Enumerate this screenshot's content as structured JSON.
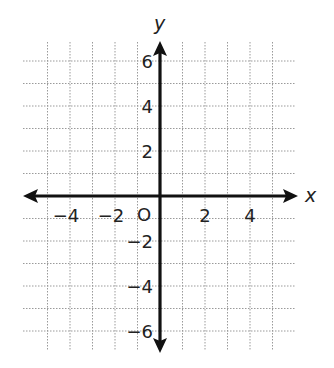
{
  "diagram": {
    "type": "coordinate-plane",
    "x_axis_label": "x",
    "y_axis_label": "y",
    "origin_label": "O",
    "x_range": [
      -6,
      6
    ],
    "y_range": [
      -6,
      6
    ],
    "grid_step": 1,
    "x_tick_labels": [
      "−4",
      "−2",
      "2",
      "4"
    ],
    "x_tick_values": [
      -4,
      -2,
      2,
      4
    ],
    "y_tick_labels": [
      "6",
      "4",
      "2",
      "−2",
      "−4",
      "−6"
    ],
    "y_tick_values": [
      6,
      4,
      2,
      -2,
      -4,
      -6
    ],
    "colors": {
      "axis": "#111111",
      "grid": "#9a9a9a",
      "label": "#222222"
    }
  }
}
